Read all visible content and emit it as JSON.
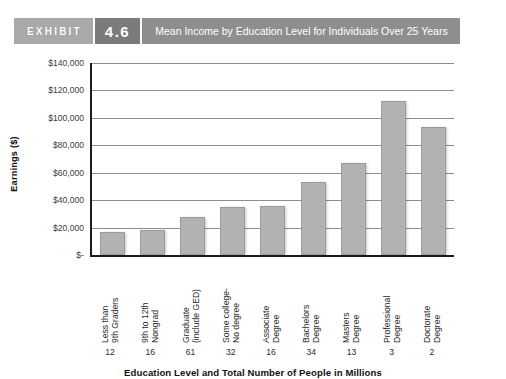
{
  "exhibit": {
    "word": "EXHIBIT",
    "number": "4.6",
    "title": "Mean Income by Education Level for Individuals Over 25 Years"
  },
  "chart_data": {
    "type": "bar",
    "title": "Mean Income by Education Level for Individuals Over 25 Years",
    "xlabel": "Education Level and Total Number of People in Millions",
    "ylabel": "Earnings ($)",
    "ylim": [
      0,
      140000
    ],
    "ytick_step": 20000,
    "ytick_labels": [
      "$140,000",
      "$120,000",
      "$100,000",
      "$80,000",
      "$60,000",
      "$40,000",
      "$20,000",
      "$-"
    ],
    "ytick_values": [
      140000,
      120000,
      100000,
      80000,
      60000,
      40000,
      20000,
      0
    ],
    "grid": true,
    "legend": "none",
    "categories": [
      "Less than 9th Graders",
      "9th to 12th Nongrad",
      "Graduate (include GED)",
      "Some college- No degree",
      "Associate Degree",
      "Bachelors Degree",
      "Masters Degree",
      "Professional Degree",
      "Doctorate Degree"
    ],
    "category_lines": [
      [
        "Less than",
        "9th Graders"
      ],
      [
        "9th to 12th",
        "Nongrad"
      ],
      [
        "Graduate",
        "(include GED)"
      ],
      [
        "Some college-",
        "No degree"
      ],
      [
        "Associate",
        "Degree"
      ],
      [
        "Bachelors",
        "Degree"
      ],
      [
        "Masters",
        "Degree"
      ],
      [
        "Professional",
        "Degree"
      ],
      [
        "Doctorate",
        "Degree"
      ]
    ],
    "values": [
      17000,
      18500,
      28000,
      35000,
      36000,
      53000,
      67000,
      112000,
      93000
    ],
    "counts_millions": [
      12,
      16,
      61,
      32,
      16,
      34,
      13,
      3,
      2
    ],
    "bar_color": "#b2b2b2"
  }
}
